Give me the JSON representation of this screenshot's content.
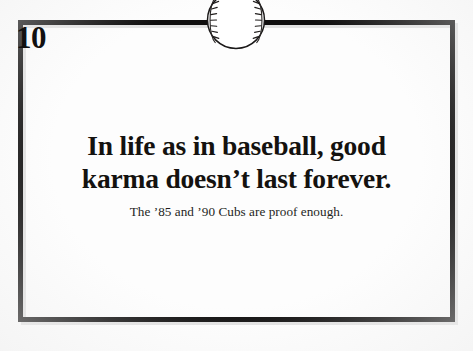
{
  "page": {
    "type": "book-page-scan",
    "background_color": "#fdfdfd",
    "frame_color": "#100f0f"
  },
  "chapter_badge": {
    "icon": "baseball-icon",
    "number": "10"
  },
  "body": {
    "headline_line_1": "In life as in baseball, good",
    "headline_line_2": "karma doesn’t last forever.",
    "subtitle": "The ’85 and ’90 Cubs are proof enough."
  }
}
